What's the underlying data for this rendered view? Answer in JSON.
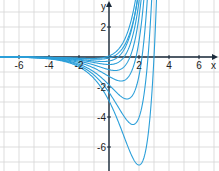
{
  "chart_data": {
    "type": "line",
    "title": "",
    "xlabel": "x",
    "ylabel": "y",
    "xlim": [
      -7.2,
      7.3
    ],
    "ylim": [
      -7.6,
      3.8
    ],
    "grid": true,
    "x_ticks": [
      "-6",
      "-4",
      "-2",
      "2",
      "4",
      "6"
    ],
    "y_ticks": [
      "2",
      "-2",
      "-4",
      "-6"
    ],
    "series_minima": [
      {
        "name": "curve1",
        "min_x": 2.0,
        "min_y": -7.2
      },
      {
        "name": "curve2",
        "min_x": 1.6,
        "min_y": -4.5
      },
      {
        "name": "curve3",
        "min_x": 1.2,
        "min_y": -2.8
      },
      {
        "name": "curve4",
        "min_x": 0.8,
        "min_y": -1.6
      },
      {
        "name": "curve5",
        "min_x": 0.4,
        "min_y": -0.9
      },
      {
        "name": "curve6",
        "min_x": 0.0,
        "min_y": -0.5
      },
      {
        "name": "curve7",
        "min_x": -0.4,
        "min_y": -0.3
      },
      {
        "name": "curve8",
        "min_x": -0.8,
        "min_y": -0.15
      },
      {
        "name": "curve9",
        "min_x": -1.2,
        "min_y": -0.1
      }
    ],
    "line_color": "#2b9fd9"
  }
}
